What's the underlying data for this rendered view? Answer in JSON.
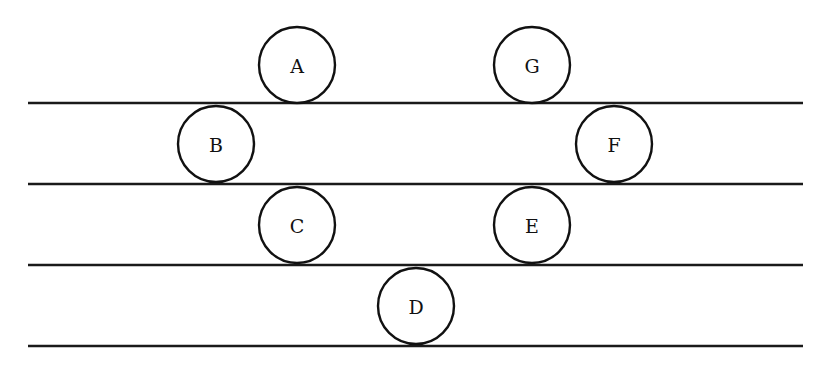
{
  "diagram": {
    "type": "seating/arrangement",
    "colors": {
      "stroke": "#111111",
      "background": "#ffffff"
    },
    "lines": [
      {
        "id": "line-1",
        "y": 103,
        "x1": 28,
        "x2": 803
      },
      {
        "id": "line-2",
        "y": 184,
        "x1": 28,
        "x2": 803
      },
      {
        "id": "line-3",
        "y": 265,
        "x1": 28,
        "x2": 803
      },
      {
        "id": "line-4",
        "y": 346,
        "x1": 28,
        "x2": 803
      }
    ],
    "nodes": [
      {
        "label": "A",
        "cx": 297,
        "cy": 65,
        "r": 38
      },
      {
        "label": "B",
        "cx": 216,
        "cy": 144,
        "r": 38
      },
      {
        "label": "C",
        "cx": 297,
        "cy": 225,
        "r": 38
      },
      {
        "label": "D",
        "cx": 416,
        "cy": 306,
        "r": 38
      },
      {
        "label": "E",
        "cx": 532,
        "cy": 225,
        "r": 38
      },
      {
        "label": "F",
        "cx": 614,
        "cy": 144,
        "r": 38
      },
      {
        "label": "G",
        "cx": 532,
        "cy": 65,
        "r": 38
      }
    ]
  }
}
